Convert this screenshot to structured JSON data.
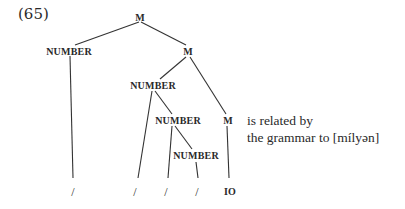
{
  "example_number": "(65)",
  "tree": {
    "nodes": {
      "root": "M",
      "left_number": "NUMBER",
      "right_m": "M",
      "mid_number": "NUMBER",
      "inner_number": "NUMBER",
      "lower_m": "M",
      "deepest_number": "NUMBER"
    },
    "leaves": [
      "/",
      "/",
      "/",
      "/",
      "IO"
    ]
  },
  "caption": {
    "line1": "is related by",
    "line2": "the grammar to [mílyən]"
  }
}
